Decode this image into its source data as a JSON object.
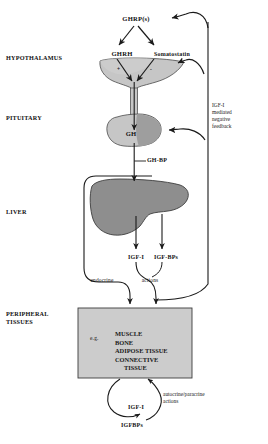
{
  "colors": {
    "organ_fill": "#b9b9b9",
    "organ_fill_light": "#cfcfcf",
    "organ_stroke": "#4a4a4a",
    "box_fill": "#cccccc",
    "line": "#1a1a1a",
    "background": "#ffffff"
  },
  "side_labels": [
    {
      "id": "hypothalamus",
      "text": "HYPOTHALAMUS",
      "x": 6,
      "y": 57
    },
    {
      "id": "pituitary",
      "text": "PITUITARY",
      "x": 6,
      "y": 117
    },
    {
      "id": "liver",
      "text": "LIVER",
      "x": 6,
      "y": 211
    },
    {
      "id": "peripheral-tissues-line1",
      "text": "PERIPHERAL",
      "x": 6,
      "y": 313
    },
    {
      "id": "peripheral-tissues-line2",
      "text": "TISSUES",
      "x": 6,
      "y": 321
    }
  ],
  "nodes": {
    "ghrp": "GHRP(s)",
    "ghrh": "GHRH",
    "somatostatin": "Somatostatin",
    "plus_sign": "+",
    "minus_sign": "-",
    "gh": "GH",
    "gh_bp": "GH-BP",
    "igf_i_liver": "IGF-I",
    "igf_bps_liver": "IGF-BPs",
    "endocrine": "endocrine",
    "actions": "actions",
    "igf_i_bottom": "IGF-I",
    "igfbps_bottom": "IGFBPs"
  },
  "feedback_label": {
    "lines": [
      "IGF-I",
      "mediated",
      "negative",
      "feedback"
    ]
  },
  "autocrine_label": {
    "lines": [
      "autocrine/paracrine",
      "actions"
    ]
  },
  "tissue_box": {
    "eg": "e.g.",
    "items": [
      "MUSCLE",
      "BONE",
      "ADIPOSE TISSUE",
      "CONNECTIVE",
      "TISSUE"
    ]
  }
}
